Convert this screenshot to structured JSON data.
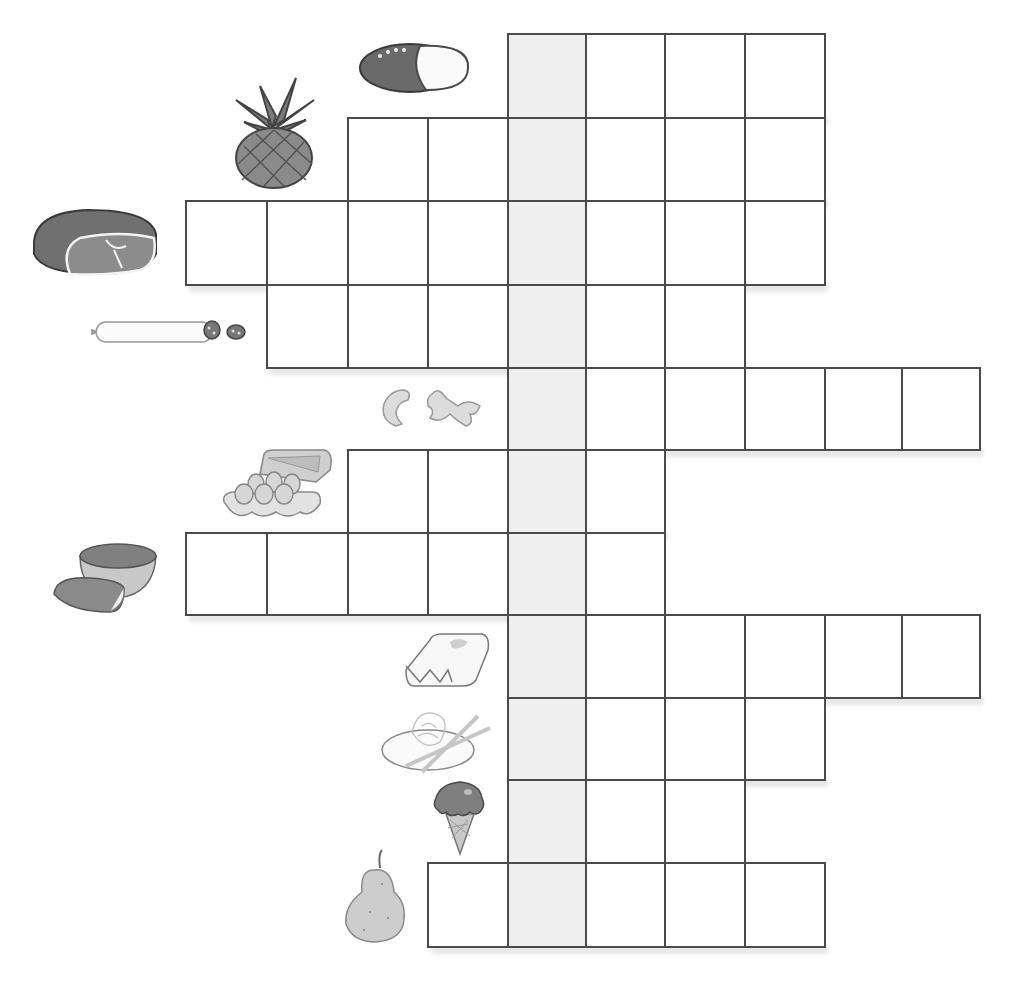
{
  "puzzle": {
    "type": "picture-crossword",
    "solution_column": 4,
    "colors": {
      "grid_line": "#4a4a4a",
      "solution_fill": "#efefef",
      "cell_fill": "#ffffff",
      "shadow": "#e6e6e6"
    },
    "col_edges": [
      185,
      266,
      347,
      427,
      507,
      585,
      664,
      744,
      824,
      901,
      979
    ],
    "row_edges": [
      33,
      117,
      200,
      284,
      367,
      449,
      532,
      614,
      697,
      779,
      862,
      946
    ],
    "rows": [
      {
        "clue_icon": "bread-icon",
        "start_col": 4,
        "end_col": 7,
        "answer": ""
      },
      {
        "clue_icon": "pineapple-icon",
        "start_col": 2,
        "end_col": 7,
        "answer": ""
      },
      {
        "clue_icon": "ham-icon",
        "start_col": 0,
        "end_col": 7,
        "answer": ""
      },
      {
        "clue_icon": "salami-icon",
        "start_col": 1,
        "end_col": 6,
        "answer": ""
      },
      {
        "clue_icon": "pasta-icon",
        "start_col": 4,
        "end_col": 9,
        "answer": ""
      },
      {
        "clue_icon": "eggs-icon",
        "start_col": 2,
        "end_col": 5,
        "answer": ""
      },
      {
        "clue_icon": "melon-icon",
        "start_col": 0,
        "end_col": 5,
        "answer": ""
      },
      {
        "clue_icon": "butter-icon",
        "start_col": 4,
        "end_col": 9,
        "answer": ""
      },
      {
        "clue_icon": "noodles-icon",
        "start_col": 4,
        "end_col": 7,
        "answer": ""
      },
      {
        "clue_icon": "ice-cream-icon",
        "start_col": 4,
        "end_col": 6,
        "answer": ""
      },
      {
        "clue_icon": "pear-icon",
        "start_col": 3,
        "end_col": 7,
        "answer": ""
      }
    ]
  }
}
